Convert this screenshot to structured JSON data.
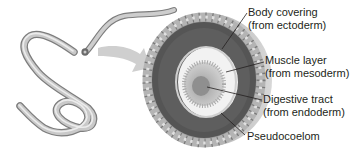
{
  "diagram": {
    "labels": [
      {
        "line1": "Body covering",
        "line2": "(from ectoderm)"
      },
      {
        "line1": "Muscle layer",
        "line2": "(from mesoderm)"
      },
      {
        "line1": "Digestive tract",
        "line2": "(from endoderm)"
      },
      {
        "line1": "Pseudocoelom",
        "line2": ""
      }
    ]
  }
}
